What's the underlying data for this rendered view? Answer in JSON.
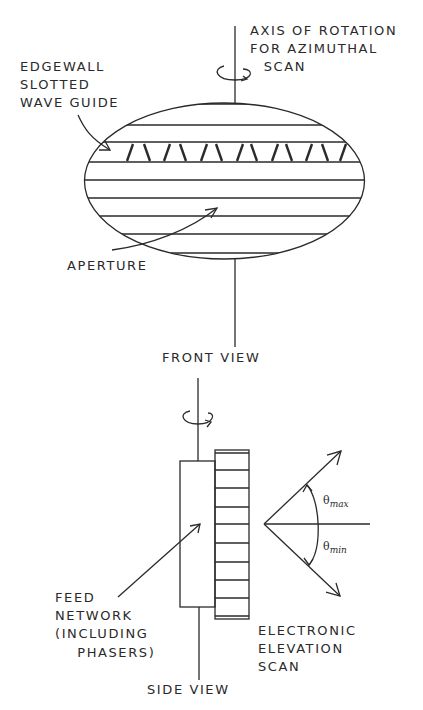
{
  "front_view": {
    "title": "FRONT VIEW",
    "axis_label": [
      "AXIS OF ROTATION",
      "FOR AZIMUTHAL",
      " SCAN"
    ],
    "waveguide_label": [
      "EDGEWALL",
      "SLOTTED",
      "WAVE GUIDE"
    ],
    "aperture_label": "APERTURE",
    "slot_count": 12,
    "aperture_rows": 8
  },
  "side_view": {
    "title": "SIDE VIEW",
    "feed_label": [
      "FEED",
      "NETWORK",
      "(INCLUDING",
      "   PHASERS)"
    ],
    "scan_label": [
      "ELECTRONIC",
      "ELEVATION",
      "SCAN"
    ],
    "theta_max": {
      "symbol": "θ",
      "subscript": "max"
    },
    "theta_min": {
      "symbol": "θ",
      "subscript": "min"
    },
    "array_elements": 8
  },
  "icons": {
    "rotation_arrow": "rotation-arrow-icon"
  },
  "colors": {
    "ink": "#2a2a2a",
    "paper": "#ffffff"
  }
}
